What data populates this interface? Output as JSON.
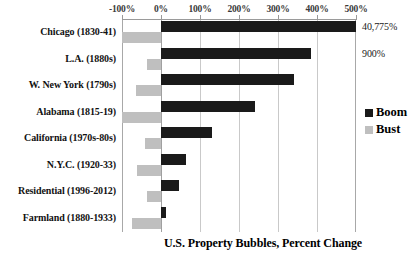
{
  "chart_data": {
    "type": "bar",
    "orientation": "horizontal",
    "title": "U.S. Property Bubbles, Percent Change",
    "xlabel": "U.S. Property Bubbles, Percent Change",
    "ylabel": "",
    "xlim": [
      -100,
      500
    ],
    "xticks": [
      -100,
      0,
      100,
      200,
      300,
      400,
      500
    ],
    "xtick_labels": [
      "-100%",
      "0%",
      "100%",
      "200%",
      "300%",
      "400%",
      "500%"
    ],
    "grid": true,
    "legend_position": "right",
    "categories": [
      "Chicago (1830-41)",
      "L.A. (1880s)",
      "W. New York (1790s)",
      "Alabama (1815-19)",
      "California (1970s-80s)",
      "N.Y.C. (1920-33)",
      "Residential (1996-2012)",
      "Farmland (1880-1933)"
    ],
    "series": [
      {
        "name": "Boom",
        "color": "#1a1a1a",
        "values": [
          40775,
          900,
          340,
          240,
          130,
          65,
          45,
          12
        ],
        "plotted_values": [
          520,
          385,
          340,
          240,
          130,
          65,
          45,
          12
        ],
        "data_labels": [
          "40,775%",
          "900%",
          "",
          "",
          "",
          "",
          "",
          ""
        ]
      },
      {
        "name": "Bust",
        "color": "#bfbfbf",
        "values": [
          -100,
          -35,
          -65,
          -100,
          -40,
          -62,
          -37,
          -75
        ],
        "plotted_values": [
          -100,
          -35,
          -65,
          -100,
          -40,
          -62,
          -37,
          -75
        ],
        "data_labels": [
          "",
          "",
          "",
          "",
          "",
          "",
          "",
          ""
        ]
      }
    ]
  },
  "legend": {
    "items": [
      {
        "label": "Boom",
        "color": "#1a1a1a"
      },
      {
        "label": "Bust",
        "color": "#bfbfbf"
      }
    ]
  }
}
